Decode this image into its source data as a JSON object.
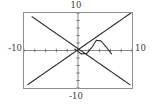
{
  "figure": {
    "background_color": "#ffffff",
    "frame_color": "#8e8e96",
    "curve_color": "#2b2b2b",
    "axis_color": "#555560",
    "label_color": "#3a3a3a"
  },
  "labels": {
    "top": "10",
    "bottom": "-10",
    "left": "-10",
    "right": "10"
  },
  "chart_data": {
    "type": "line",
    "title": "",
    "xlabel": "",
    "ylabel": "",
    "xlim": [
      -10,
      10
    ],
    "ylim": [
      -10,
      10
    ],
    "xticks": [
      -10,
      -8,
      -6,
      -4,
      -2,
      0,
      2,
      4,
      6,
      8,
      10
    ],
    "yticks": [
      -10,
      -8,
      -6,
      -4,
      -2,
      0,
      2,
      4,
      6,
      8,
      10
    ],
    "tick_labels_shown": [
      "10",
      "-10",
      "-10",
      "10"
    ],
    "grid": false,
    "legend": null,
    "axes_style": "centered-cross-with-ticks",
    "series": [
      {
        "name": "descending-line",
        "style": "dotted",
        "slope": -1,
        "intercept": 0.5,
        "x": [
          -8.5,
          -6,
          -4,
          -2,
          0,
          2,
          4,
          6,
          8,
          9.6
        ],
        "values": [
          9.0,
          6.5,
          4.5,
          2.5,
          0.5,
          -1.5,
          -3.5,
          -5.5,
          -7.5,
          -9.1
        ]
      },
      {
        "name": "ascending-line",
        "style": "dotted",
        "slope": 1,
        "intercept": 0.2,
        "x": [
          -9.3,
          -8,
          -6,
          -4,
          -2,
          0,
          2,
          4,
          6,
          8,
          9.8
        ],
        "values": [
          -9.1,
          -7.8,
          -5.8,
          -3.8,
          -1.8,
          0.2,
          2.2,
          4.2,
          6.2,
          8.2,
          10.0
        ]
      },
      {
        "name": "v-peak-curve",
        "style": "dotted",
        "x": [
          -0.6,
          0.6,
          1.6,
          2.6,
          3.4,
          4.2,
          5.2,
          6.2
        ],
        "values": [
          0.4,
          -0.9,
          -0.8,
          0.9,
          2.7,
          2.6,
          1.0,
          -0.9
        ]
      }
    ]
  }
}
